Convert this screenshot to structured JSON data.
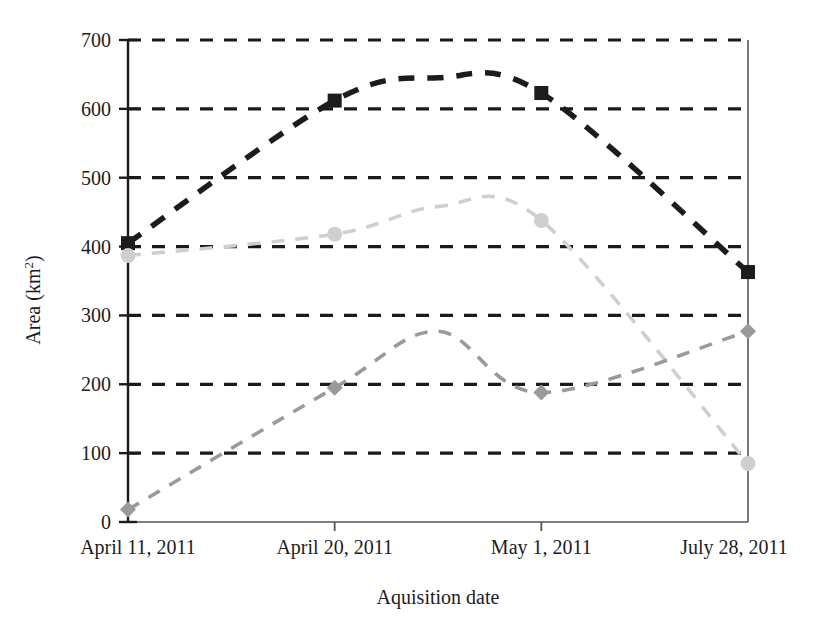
{
  "chart_data": {
    "type": "line",
    "title": "",
    "xlabel": "Aquisition date",
    "ylabel": "Area (km2)",
    "ylabel_base": "Area (km",
    "ylabel_sup": "2",
    "ylabel_close": ")",
    "categories": [
      "April 11, 2011",
      "April 20, 2011",
      "May 1, 2011",
      "July 28, 2011"
    ],
    "ylim": [
      0,
      700
    ],
    "yticks": [
      0,
      100,
      200,
      300,
      400,
      500,
      600,
      700
    ],
    "ytick_labels": [
      "0",
      "100",
      "200",
      "300",
      "400",
      "500",
      "600",
      "700"
    ],
    "grid": true,
    "grid_style": "dashed",
    "grid_color": "#1a1a1a",
    "legend": "none",
    "smoothing": "spline",
    "line_style": "dashed",
    "series": [
      {
        "name": "series-dark",
        "color": "#1c1c1c",
        "marker": "square",
        "values": [
          405,
          612,
          623,
          363
        ],
        "peak_value": 645
      },
      {
        "name": "series-light",
        "color": "#cfcfcf",
        "marker": "circle",
        "values": [
          387,
          418,
          438,
          85
        ],
        "peak_value": 458
      },
      {
        "name": "series-medium",
        "color": "#9a9a9a",
        "marker": "diamond",
        "values": [
          18,
          195,
          188,
          277
        ],
        "peak_value": 277
      }
    ]
  },
  "axes": {
    "plot_left_px": 128,
    "plot_right_px": 748,
    "plot_top_px": 40,
    "plot_bottom_px": 522
  }
}
